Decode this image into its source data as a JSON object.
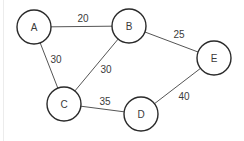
{
  "diagram": {
    "type": "weighted-undirected-graph",
    "colors": {
      "background": "#ffffff",
      "node_stroke": "#2a2a2a",
      "edge_stroke": "#555555",
      "text": "#3a3a3a"
    },
    "nodes": [
      {
        "id": "A",
        "label": "A",
        "cx": 34,
        "cy": 27,
        "r": 17
      },
      {
        "id": "B",
        "label": "B",
        "cx": 129,
        "cy": 26,
        "r": 17
      },
      {
        "id": "C",
        "label": "C",
        "cx": 64,
        "cy": 104,
        "r": 17
      },
      {
        "id": "D",
        "label": "D",
        "cx": 141,
        "cy": 114,
        "r": 17
      },
      {
        "id": "E",
        "label": "E",
        "cx": 214,
        "cy": 58,
        "r": 17
      }
    ],
    "edges": [
      {
        "from": "A",
        "to": "B",
        "weight": "20",
        "lx": 83,
        "ly": 18
      },
      {
        "from": "A",
        "to": "C",
        "weight": "30",
        "lx": 56,
        "ly": 59
      },
      {
        "from": "B",
        "to": "C",
        "weight": "30",
        "lx": 106,
        "ly": 69
      },
      {
        "from": "B",
        "to": "E",
        "weight": "25",
        "lx": 179,
        "ly": 34
      },
      {
        "from": "C",
        "to": "D",
        "weight": "35",
        "lx": 105,
        "ly": 101
      },
      {
        "from": "D",
        "to": "E",
        "weight": "40",
        "lx": 184,
        "ly": 96
      }
    ]
  }
}
